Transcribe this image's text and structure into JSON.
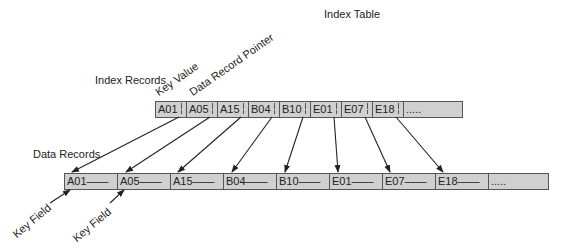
{
  "title": "Index Table",
  "labels": {
    "index_records": "Index Records",
    "key_value": "Key Value",
    "data_record_pointer": "Data Record Pointer",
    "data_records": "Data Records",
    "key_field_1": "Key Field",
    "key_field_2": "Key Field"
  },
  "index_table": {
    "cells": [
      "A01",
      "A05",
      "A15",
      "B04",
      "B10",
      "E01",
      "E07",
      "E18",
      "....."
    ]
  },
  "data_records": {
    "cells": [
      "A01——",
      "A05——",
      "A15——",
      "B04——",
      "B10——",
      "E01——",
      "E07——",
      "E18——",
      "....."
    ]
  },
  "colors": {
    "cell_fill": "#d0d0d0",
    "border": "#555555",
    "arrow": "#222222"
  }
}
